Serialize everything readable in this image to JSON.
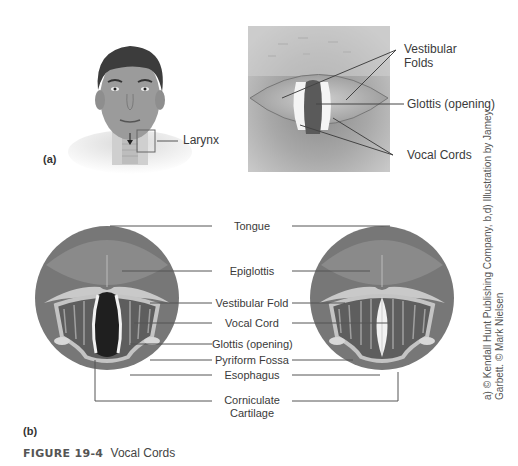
{
  "panel_a": {
    "letter": "(a)",
    "head_label": "Larynx",
    "photo_labels": {
      "vestibular_folds_line1": "Vestibular",
      "vestibular_folds_line2": "Folds",
      "glottis": "Glottis (opening)",
      "vocal_cords": "Vocal Cords"
    }
  },
  "panel_b": {
    "letter": "(b)",
    "labels": {
      "tongue": "Tongue",
      "epiglottis": "Epiglottis",
      "vestibular_fold": "Vestibular Fold",
      "vocal_cord": "Vocal Cord",
      "glottis": "Glottis (opening)",
      "pyriform_fossa": "Pyriform Fossa",
      "esophagus": "Esophagus",
      "corniculate_line1": "Corniculate",
      "corniculate_line2": "Cartilage"
    }
  },
  "credit": {
    "line1": "a) © Kendall Hunt Publishing Company, b,d) Illustration by Jamey",
    "line2": "Garbett. © Mark Nielsen"
  },
  "caption": {
    "figure_number": "FIGURE 19-4",
    "title": "Vocal Cords"
  }
}
